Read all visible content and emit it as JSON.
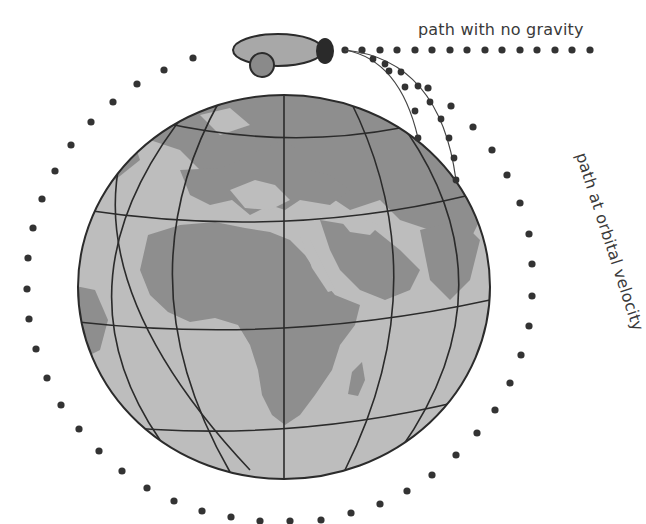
{
  "diagram": {
    "labels": {
      "no_gravity": "path with no gravity",
      "orbital_velocity": "path at orbital velocity"
    },
    "colors": {
      "background": "#ffffff",
      "ocean": "#bdbdbd",
      "land": "#8e8e8e",
      "grid_lines": "#2b2b2b",
      "dots": "#333333",
      "mountain": "#a8a8a8",
      "cannon": "#7a7a7a",
      "cannonball": "#2a2a2a",
      "text": "#3a3a3a"
    },
    "globe": {
      "cx": 284,
      "cy": 287,
      "rx": 206,
      "ry": 192
    },
    "elements": [
      "globe with latitude/longitude grid showing Europe and Africa",
      "mountain with cannon on top of globe",
      "straight dotted path with no gravity",
      "curved dotted paths falling to Earth",
      "circular dotted orbital path"
    ]
  }
}
